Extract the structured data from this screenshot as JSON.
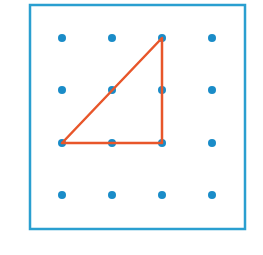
{
  "figure": {
    "type": "geoboard",
    "border_color": "#2a9fd0",
    "dot_color": "#1a8cc8",
    "shape_color": "#e8562a",
    "grid": {
      "columns": 4,
      "rows": 4,
      "x": [
        62,
        112,
        162,
        212
      ],
      "y": [
        38,
        90,
        143,
        195
      ]
    },
    "triangle": {
      "vertices_grid": [
        [
          2,
          0
        ],
        [
          0,
          2
        ],
        [
          2,
          2
        ]
      ]
    }
  }
}
